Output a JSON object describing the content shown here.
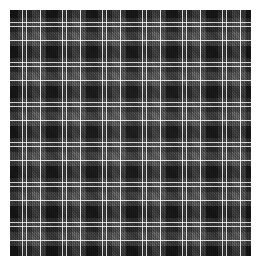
{
  "image": {
    "subject": "tartan-plaid-fabric-swatch",
    "description": "Dark charcoal and black tartan plaid fabric swatch with fine white pinstripes",
    "width_px": 260,
    "height_px": 265,
    "background_color": "#ffffff",
    "margin_px": 10
  },
  "fabric": {
    "weave": "twill",
    "sett_repeat_px": 40,
    "symmetric_sett": true,
    "palette": {
      "black": "#080808",
      "near_black": "#121212",
      "dark_charcoal": "#1c1c1c",
      "charcoal": "#262626",
      "mid_grey": "#333333",
      "light_grey": "#4a4a4a",
      "pinstripe_white": "#c9c9c9",
      "pinstripe_bright": "#dedede"
    },
    "warp_sequence": [
      {
        "color": "#080808",
        "width_px": 12,
        "name": "black-block"
      },
      {
        "color": "#1c1c1c",
        "width_px": 4,
        "name": "dark-charcoal-band"
      },
      {
        "color": "#cfcfcf",
        "width_px": 1,
        "name": "white-pinstripe"
      },
      {
        "color": "#232323",
        "width_px": 3,
        "name": "charcoal-gap"
      },
      {
        "color": "#cfcfcf",
        "width_px": 1,
        "name": "white-pinstripe"
      },
      {
        "color": "#1a1a1a",
        "width_px": 5,
        "name": "dark-charcoal-band"
      },
      {
        "color": "#2e2e2e",
        "width_px": 8,
        "name": "mid-grey-block"
      },
      {
        "color": "#dedede",
        "width_px": 1,
        "name": "white-pinstripe-bright"
      },
      {
        "color": "#2a2a2a",
        "width_px": 5,
        "name": "mid-grey-tail"
      }
    ],
    "weft_sequence": [
      {
        "color": "#080808",
        "height_px": 12,
        "name": "black-block"
      },
      {
        "color": "#1c1c1c",
        "height_px": 4,
        "name": "dark-charcoal-band"
      },
      {
        "color": "#cfcfcf",
        "height_px": 1,
        "name": "white-pinstripe"
      },
      {
        "color": "#232323",
        "height_px": 3,
        "name": "charcoal-gap"
      },
      {
        "color": "#cfcfcf",
        "height_px": 1,
        "name": "white-pinstripe"
      },
      {
        "color": "#1a1a1a",
        "height_px": 5,
        "name": "dark-charcoal-band"
      },
      {
        "color": "#2e2e2e",
        "height_px": 8,
        "name": "mid-grey-block"
      },
      {
        "color": "#dedede",
        "height_px": 1,
        "name": "white-pinstripe-bright"
      },
      {
        "color": "#2a2a2a",
        "height_px": 5,
        "name": "mid-grey-tail"
      }
    ]
  }
}
